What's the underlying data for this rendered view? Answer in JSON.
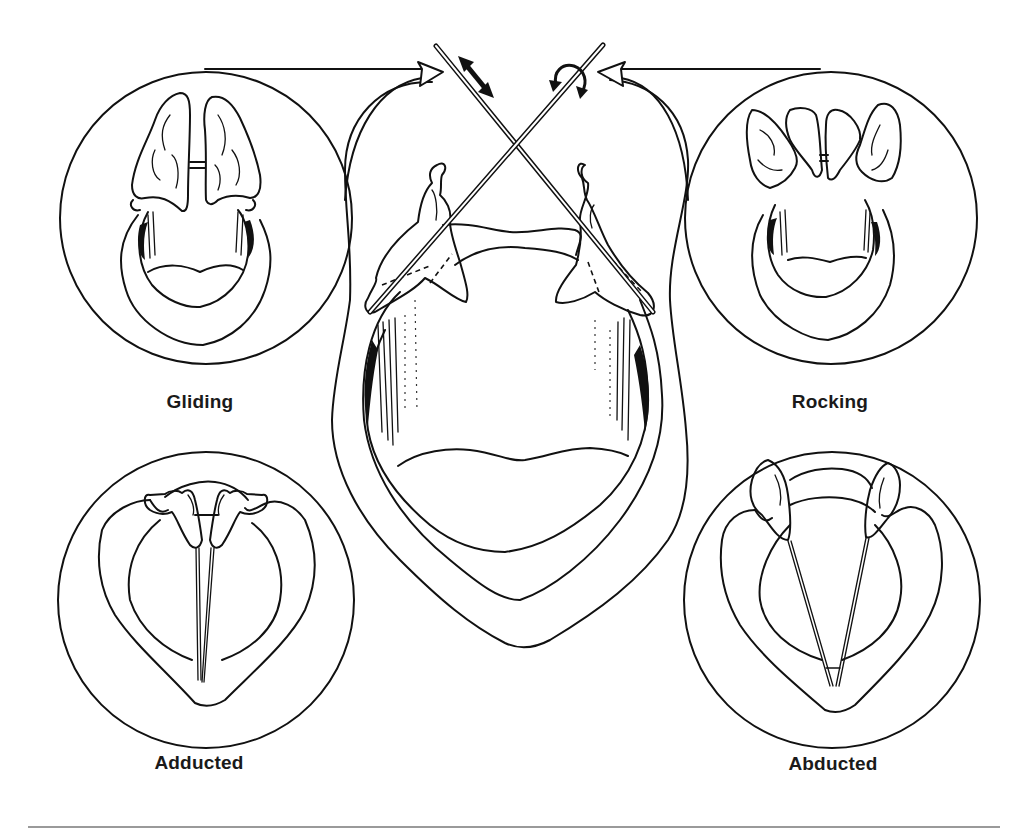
{
  "figure": {
    "labels": {
      "gliding": "Gliding",
      "rocking": "Rocking",
      "adducted": "Adducted",
      "abducted": "Abducted"
    },
    "insets": [
      {
        "id": "gliding",
        "label": "Gliding",
        "position": "top-left"
      },
      {
        "id": "rocking",
        "label": "Rocking",
        "position": "top-right"
      },
      {
        "id": "adducted",
        "label": "Adducted",
        "position": "bottom-left"
      },
      {
        "id": "abducted",
        "label": "Abducted",
        "position": "bottom-right"
      }
    ],
    "motion_indicators": [
      {
        "type": "double-headed-arrow",
        "meaning": "gliding motion along rod"
      },
      {
        "type": "curved-rotation-arrow",
        "meaning": "rocking rotation around rod"
      }
    ],
    "colors": {
      "line": "#111111",
      "background": "#ffffff",
      "rule": "#9a9a9a"
    }
  }
}
